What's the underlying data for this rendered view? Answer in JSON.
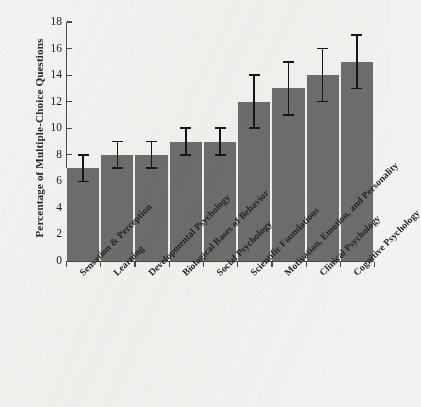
{
  "chart_data": {
    "type": "bar",
    "title": "",
    "xlabel": "",
    "ylabel": "Percentage of Multiple-Choice Questions",
    "ylim": [
      0,
      18
    ],
    "yticks": [
      0,
      2,
      4,
      6,
      8,
      10,
      12,
      14,
      16,
      18
    ],
    "ytick_labels": [
      "0",
      "2",
      "4",
      "6",
      "8",
      "10",
      "12",
      "14",
      "16",
      "18"
    ],
    "grid": false,
    "legend": null,
    "bar_color": "#6d6d6d",
    "errorbar_color": "#161616",
    "background_color": "#f2f2f0",
    "categories": [
      "Sensation & Perception",
      "Learning",
      "Developmental Psychology",
      "Biological Bases of Behavior",
      "Social Psychology",
      "Scientific Foundations",
      "Motivation, Emotion, and Personality",
      "Clinical Psychology",
      "Cognitive Psychology"
    ],
    "values": [
      7,
      8,
      8,
      9,
      9,
      12,
      13,
      14,
      15
    ],
    "error_low": [
      6,
      7,
      7,
      8,
      8,
      10,
      11,
      12,
      13
    ],
    "error_high": [
      8,
      9,
      9,
      10,
      10,
      14,
      15,
      16,
      17
    ],
    "series": [
      {
        "name": "Percentage of Multiple-Choice Questions",
        "values": [
          7,
          8,
          8,
          9,
          9,
          12,
          13,
          14,
          15
        ]
      }
    ]
  }
}
